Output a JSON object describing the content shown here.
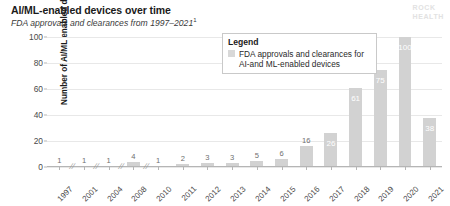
{
  "header": {
    "title": "AI/ML-enabled devices over time",
    "subtitle": "FDA approvals and clearances from 1997–2021",
    "footnote_marker": "1"
  },
  "brand": {
    "line1": "ROCK",
    "line2": "HEALTH"
  },
  "legend": {
    "title": "Legend",
    "entry_label": "FDA approvals and clearances for AI-and ML-enabled devices",
    "swatch_color": "#d8d8d8"
  },
  "colors": {
    "bar": "#d2d2d2",
    "grid": "#e8e8e8",
    "axis": "#b5b5b5",
    "label_outside": "#6f6f6f",
    "label_inside": "#ffffff",
    "logo": "#e2e2e2"
  },
  "chart_data": {
    "type": "bar",
    "title": "AI/ML-enabled devices over time",
    "subtitle": "FDA approvals and clearances from 1997–2021",
    "xlabel": "",
    "ylabel": "Number of AI/ML enabled devices",
    "ylim": [
      0,
      105
    ],
    "yticks": [
      0,
      20,
      40,
      60,
      80,
      100
    ],
    "ytick_labels": [
      "0",
      "20",
      "40",
      "60",
      "80",
      "100"
    ],
    "grid": true,
    "legend_position": "top-right-inside",
    "axis_breaks_after": [
      "1997",
      "2001",
      "2004",
      "2008"
    ],
    "categories": [
      "1997",
      "2001",
      "2004",
      "2008",
      "2010",
      "2011",
      "2012",
      "2013",
      "2014",
      "2015",
      "2016",
      "2017",
      "2018",
      "2019",
      "2020",
      "2021"
    ],
    "values": [
      1,
      1,
      1,
      4,
      1,
      2,
      3,
      3,
      5,
      6,
      16,
      26,
      61,
      75,
      100,
      38
    ],
    "series": [
      {
        "name": "FDA approvals and clearances for AI-and ML-enabled devices",
        "values": [
          1,
          1,
          1,
          4,
          1,
          2,
          3,
          3,
          5,
          6,
          16,
          26,
          61,
          75,
          100,
          38
        ]
      }
    ]
  }
}
